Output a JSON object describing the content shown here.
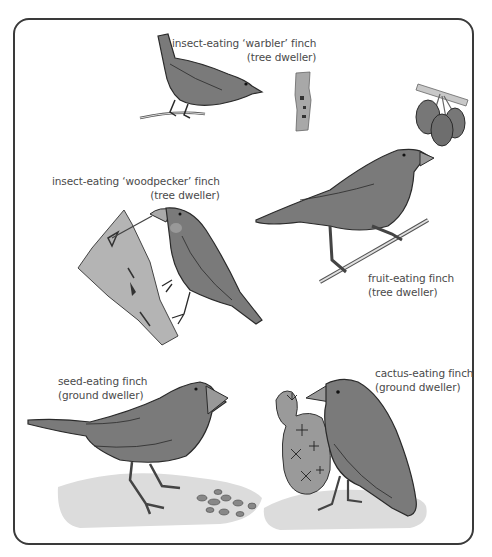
{
  "diagram": {
    "type": "illustration",
    "colors": {
      "border": "#3a3a3a",
      "bird_fill": "#7a7a7a",
      "bird_outline": "#2a2a2a",
      "bark": "#b4b4b4",
      "ground": "#dcdcdc",
      "text": "#4a4a4a"
    },
    "finches": [
      {
        "id": "warbler",
        "line1": "insect-eating ‘warbler’ finch",
        "line2": "(tree dweller)"
      },
      {
        "id": "woodpecker",
        "line1": "insect-eating ‘woodpecker’ finch",
        "line2": "(tree dweller)"
      },
      {
        "id": "fruit",
        "line1": "fruit-eating finch",
        "line2": "(tree dweller)"
      },
      {
        "id": "seed",
        "line1": "seed-eating finch",
        "line2": "(ground dweller)"
      },
      {
        "id": "cactus",
        "line1": "cactus-eating finch",
        "line2": "(ground dweller)"
      }
    ]
  }
}
